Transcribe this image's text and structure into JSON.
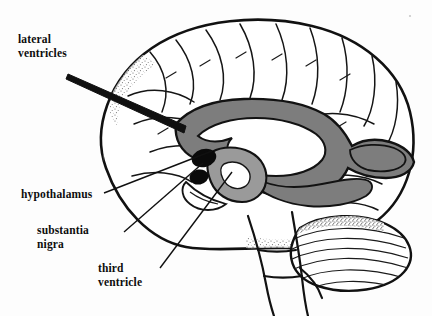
{
  "figure": {
    "background_color": "#fdfdfd",
    "ink_color": "#111111",
    "ventricle_fill": "#7d7d7d",
    "ventricle_fill_light": "#9a9a9a",
    "substantia_nigra_fill": "#0a0a0a",
    "width": 432,
    "height": 316
  },
  "labels": [
    {
      "id": "lateral-ventricles",
      "line1": "lateral",
      "line2": "ventricles",
      "target": "body of lateral ventricle"
    },
    {
      "id": "hypothalamus",
      "line1": "hypothalamus",
      "line2": "",
      "target": "hypothalamic region"
    },
    {
      "id": "substantia-nigra",
      "line1": "substantia",
      "line2": "nigra",
      "target": "black midbrain nucleus"
    },
    {
      "id": "third-ventricle",
      "line1": "third",
      "line2": "ventricle",
      "target": "midline third ventricle"
    }
  ],
  "structures": [
    {
      "name": "cerebral-cortex",
      "shading": "outline-with-stipple"
    },
    {
      "name": "lateral-ventricle",
      "shading": "mid-gray"
    },
    {
      "name": "third-ventricle",
      "shading": "light-gray"
    },
    {
      "name": "substantia-nigra",
      "shading": "solid-black"
    },
    {
      "name": "cerebellum",
      "shading": "foliated-hatching"
    },
    {
      "name": "brainstem",
      "shading": "outline"
    }
  ]
}
